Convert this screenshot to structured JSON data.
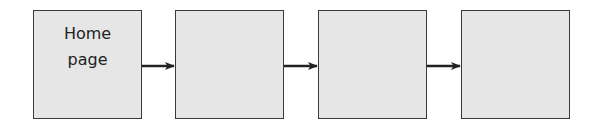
{
  "diagram": {
    "type": "flow",
    "direction": "left-to-right",
    "nodes": [
      {
        "id": "n1",
        "label": "Home\npage"
      },
      {
        "id": "n2",
        "label": ""
      },
      {
        "id": "n3",
        "label": ""
      },
      {
        "id": "n4",
        "label": ""
      }
    ],
    "edges": [
      {
        "from": "n1",
        "to": "n2"
      },
      {
        "from": "n2",
        "to": "n3"
      },
      {
        "from": "n3",
        "to": "n4"
      }
    ],
    "colors": {
      "box_fill": "#e6e6e6",
      "box_border": "#3a3a3a",
      "arrow": "#222222"
    }
  }
}
